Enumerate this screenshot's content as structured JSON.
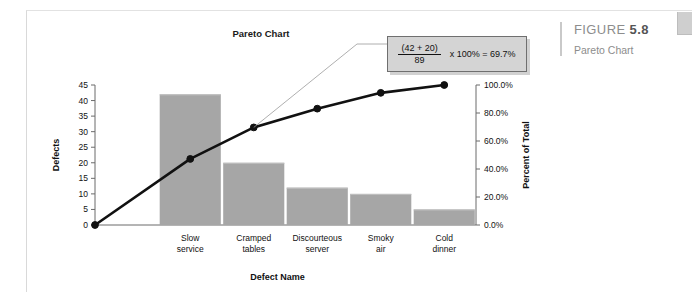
{
  "figure": {
    "label_prefix": "FIGURE",
    "number": "5.8",
    "caption": "Pareto Chart"
  },
  "callout": {
    "numerator": "(42 + 20)",
    "denominator": "89",
    "expression": "x 100% = 69.7%"
  },
  "chart_data": {
    "type": "bar",
    "title": "Pareto Chart",
    "xlabel": "Defect Name",
    "ylabel": "Defects",
    "y2label": "Percent of Total",
    "categories": [
      "Slow service",
      "Cramped tables",
      "Discourteous server",
      "Smoky air",
      "Cold dinner"
    ],
    "category_lines": [
      [
        "Slow",
        "service"
      ],
      [
        "Cramped",
        "tables"
      ],
      [
        "Discourteous",
        "server"
      ],
      [
        "Smoky",
        "air"
      ],
      [
        "Cold",
        "dinner"
      ]
    ],
    "values": [
      42,
      20,
      12,
      10,
      5
    ],
    "total": 89,
    "series": [
      {
        "name": "Defects",
        "type": "bar",
        "values": [
          42,
          20,
          12,
          10,
          5
        ]
      },
      {
        "name": "Percent of Total",
        "type": "line",
        "values": [
          47.2,
          69.7,
          83.1,
          94.4,
          100.0
        ]
      }
    ],
    "cumulative_percent": [
      47.2,
      69.7,
      83.1,
      94.4,
      100.0
    ],
    "ylim": [
      0,
      45
    ],
    "y2lim": [
      0,
      100
    ],
    "yticks": [
      0,
      5,
      10,
      15,
      20,
      25,
      30,
      35,
      40,
      45
    ],
    "ytick_labels": [
      "0",
      "5",
      "10",
      "15",
      "20",
      "25",
      "30",
      "35",
      "40",
      "45"
    ],
    "y2ticks": [
      0,
      20,
      40,
      60,
      80,
      100
    ],
    "y2tick_labels": [
      "0.0%",
      "20.0%",
      "40.0%",
      "60.0%",
      "80.0%",
      "100.0%"
    ],
    "grid": false,
    "legend": "none",
    "bar_color": "#a6a6a6",
    "line_color": "#111111",
    "annotation": "(42 + 20)/89 x 100% = 69.7%",
    "annotation_target_index": 1
  }
}
